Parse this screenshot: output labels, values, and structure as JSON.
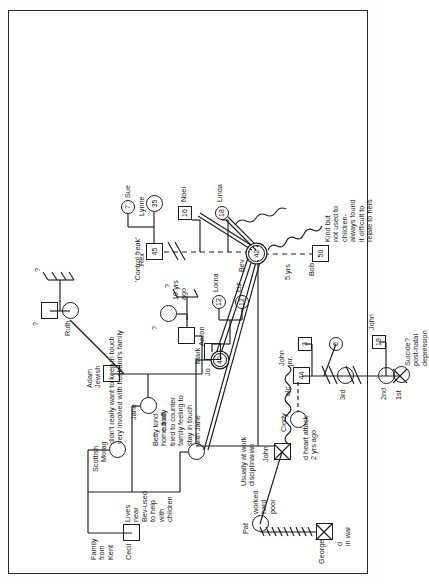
{
  "diagram": {
    "type": "genogram",
    "orientation": "rotated-90"
  },
  "people": {
    "cecil": {
      "name": "Cecil",
      "shape": "square",
      "notes": "Family from Kent"
    },
    "morag": {
      "name": "Morag",
      "shape": "circle",
      "notes": "Scottish"
    },
    "jane": {
      "name": "Jane",
      "shape": "circle",
      "notes": "cut off"
    },
    "adam": {
      "name": "Adam",
      "shape": "square",
      "notes": "Jewish"
    },
    "ruth": {
      "name": "Ruth",
      "shape": "circle"
    },
    "ruth_partner": {
      "name": "?",
      "shape": "square"
    },
    "aaron": {
      "name": "Aaron",
      "shape": "square"
    },
    "aaron_partner": {
      "name": "?",
      "shape": "circle"
    },
    "betty": {
      "name": "Betty",
      "shape": "circle",
      "notes": "kind home body tried to counter family feeling to stay in touch with Jane"
    },
    "jo": {
      "name": "Jo",
      "shape": "circle-double",
      "age": "40"
    },
    "mark": {
      "name": "Mark",
      "shape": "square"
    },
    "liz": {
      "name": "Liz",
      "shape": "circle",
      "age": "12"
    },
    "lorna": {
      "name": "Lorna",
      "shape": "circle",
      "age": "12"
    },
    "bev": {
      "name": "Bev",
      "shape": "circle-double",
      "age": "42"
    },
    "bob": {
      "name": "Bob",
      "shape": "square",
      "age": "50",
      "notes": "Kind but not used to children- always found it difficult to relate to hers"
    },
    "rex": {
      "name": "Rex",
      "shape": "square",
      "age": "45",
      "notes": "'Control freak'"
    },
    "lynne": {
      "name": "Lynne",
      "shape": "circle",
      "age": "35"
    },
    "sue": {
      "name": "Sue",
      "shape": "circle",
      "age": "7"
    },
    "noel": {
      "name": "Noel",
      "shape": "square",
      "age": "16"
    },
    "linda": {
      "name": "Linda",
      "shape": "circle",
      "age": "18"
    },
    "george": {
      "name": "George",
      "shape": "square-dead",
      "notes": "d in war"
    },
    "pat": {
      "name": "Pat",
      "shape": "circle",
      "notes": "worked hard poor"
    },
    "john": {
      "name": "John",
      "shape": "square-dead",
      "notes": "Usually at work disciplinarian",
      "death": "d heart attack 2 yrs ago"
    },
    "johnjnr": {
      "name": "John jnr.",
      "shape": "square",
      "age": "44",
      "notes": "alc"
    },
    "cindy": {
      "name": "Cindy",
      "shape": "circle"
    },
    "wife1": {
      "name": "1st",
      "shape": "circle-dead",
      "notes": "Suicide? post-natal depression"
    },
    "wife2": {
      "name": "2nd",
      "shape": "circle"
    },
    "wife3": {
      "name": "3rd",
      "shape": "circle"
    },
    "child_john19": {
      "name": "John",
      "shape": "square",
      "age": "19"
    },
    "child_3": {
      "name": "",
      "shape": "square",
      "age": "3"
    },
    "child_6": {
      "name": "",
      "shape": "circle",
      "age": "6"
    }
  },
  "labels": {
    "family_from_kent": "Family\nfrom\nKent",
    "cecil": "Cecil",
    "lives_near": "Lives\nnear\nBev-used\nto help\nwith\nchildren",
    "scottish": "Scottish",
    "morag": "Morag",
    "jane": "Jane",
    "cut_off": "cut off",
    "keep_in_touch": "didn't really want to keep in touch\nvery involved with husband's family",
    "adam": "Adam",
    "jewish": "Jewish",
    "ruth": "Ruth",
    "q1": "?",
    "q2": "?",
    "aaron": "Aaron",
    "q3": "?",
    "q4": "?",
    "betty_note": "Betty kind\nhome body\ntried to counter\nfamily feeling to\nstay in touch\nwith Jane",
    "jo": "Jo",
    "jo_age": "40",
    "mark": "Mark",
    "liz": "Liz",
    "liz_age": "12",
    "lorna": "Lorna",
    "lorna_age": "12",
    "bev": "Bev",
    "bev_age": "42",
    "bob": "Bob",
    "bob_age": "50",
    "bob_note": "Kind but\nnot used to\nchildren-\nalways found\nit difficult to\nrelate to hers",
    "five_yrs": "5 yrs",
    "ten_yrs_ago": "10 yrs\nago",
    "control_freak": "'Control freak'",
    "rex": "Rex",
    "rex_age": "45",
    "lynne": "Lynne",
    "lynne_age": "35",
    "sue": "Sue",
    "sue_age": "7",
    "noel": "Noel",
    "noel_age": "16",
    "linda": "Linda",
    "linda_age": "18",
    "george": "George",
    "george_death": "d\nin war",
    "pat": "Pat",
    "pat_note": "worked\nhard\npoor",
    "john_note": "Usually at work\ndisciplinarian",
    "john": "John",
    "john_death": "d heart attack\n2 yrs ago",
    "alc": "alc",
    "johnjnr": "John\njnr.",
    "johnjnr_age": "44",
    "cindy": "Cindy",
    "first": "1st",
    "second": "2nd",
    "third": "3rd",
    "suicide_note": "Suicide?\npost-natal\ndepression",
    "child_john": "John",
    "child_john_age": "19",
    "child_3_age": "3",
    "child_6_age": "6"
  },
  "colors": {
    "ink": "#1c1c1c",
    "paper": "#ffffff",
    "frame": "#2b2b2b"
  }
}
